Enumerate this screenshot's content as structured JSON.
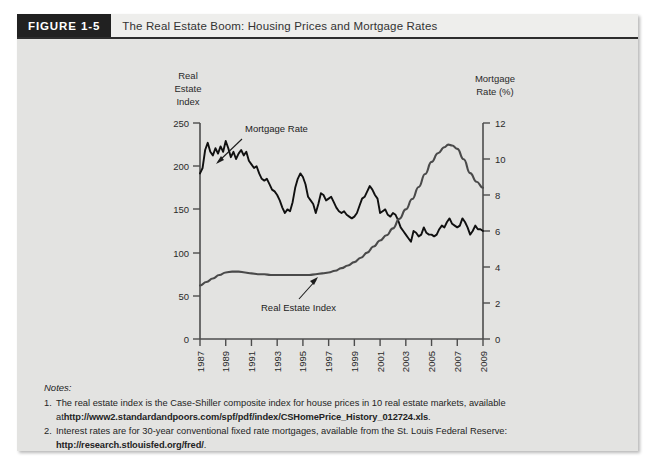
{
  "figure": {
    "tag": "FIGURE 1-5",
    "title": "The Real Estate Boom: Housing Prices and Mortgage Rates"
  },
  "axes": {
    "left_title_line1": "Real",
    "left_title_line2": "Estate",
    "left_title_line3": "Index",
    "right_title_line1": "Mortgage",
    "right_title_line2": "Rate (%)"
  },
  "annotations": {
    "mortgage_rate": "Mortgage Rate",
    "real_estate_index": "Real Estate Index"
  },
  "notes": {
    "heading": "Notes:",
    "items": [
      {
        "num": "1.",
        "text_a": "The real estate index is the Case-Shiller composite index for house prices in 10 real estate markets, available",
        "text_b_lead": "at ",
        "url": "http://www2.standardandpoors.com/spf/pdf/index/CSHomePrice_History_012724.xls",
        "text_b_tail": "."
      },
      {
        "num": "2.",
        "text_a": "Interest rates are for 30-year conventional fixed rate mortgages, available from the St. Louis Federal Reserve:",
        "text_b_lead": "",
        "url": "http://research.stlouisfed.org/fred/",
        "text_b_tail": "."
      }
    ]
  },
  "colors": {
    "tag_background": "#212121",
    "panel_background": "#e3e3e1",
    "header_background": "#eeeeec",
    "mortgage_line": "#101010",
    "real_estate_line": "#4a4a4a"
  },
  "chart_data": {
    "type": "line",
    "title": "The Real Estate Boom: Housing Prices and Mortgage Rates",
    "xlabel": "",
    "ylabel": "Real Estate Index",
    "y2label": "Mortgage Rate (%)",
    "grid": false,
    "legend": "annotated-inline",
    "xlim": [
      1987,
      2009
    ],
    "ylim": [
      0,
      250
    ],
    "y2lim": [
      0,
      12
    ],
    "xticks": [
      1987,
      1989,
      1991,
      1993,
      1995,
      1997,
      1999,
      2001,
      2003,
      2005,
      2007,
      2009
    ],
    "yticks": [
      0,
      50,
      100,
      150,
      200,
      250
    ],
    "y2ticks": [
      0,
      2,
      4,
      6,
      8,
      10,
      12
    ],
    "series": [
      {
        "name": "Mortgage Rate",
        "axis": "right",
        "unit": "%",
        "x": [
          1987.0,
          1987.2,
          1987.4,
          1987.6,
          1987.8,
          1988.0,
          1988.2,
          1988.4,
          1988.6,
          1988.8,
          1989.0,
          1989.2,
          1989.4,
          1989.6,
          1989.8,
          1990.0,
          1990.2,
          1990.4,
          1990.6,
          1990.8,
          1991.0,
          1991.2,
          1991.4,
          1991.6,
          1991.8,
          1992.0,
          1992.2,
          1992.4,
          1992.6,
          1992.8,
          1993.0,
          1993.2,
          1993.4,
          1993.6,
          1993.8,
          1994.0,
          1994.2,
          1994.4,
          1994.6,
          1994.8,
          1995.0,
          1995.2,
          1995.4,
          1995.6,
          1995.8,
          1996.0,
          1996.2,
          1996.4,
          1996.6,
          1996.8,
          1997.0,
          1997.2,
          1997.4,
          1997.6,
          1997.8,
          1998.0,
          1998.2,
          1998.4,
          1998.6,
          1998.8,
          1999.0,
          1999.2,
          1999.4,
          1999.6,
          1999.8,
          2000.0,
          2000.2,
          2000.4,
          2000.6,
          2000.8,
          2001.0,
          2001.2,
          2001.4,
          2001.6,
          2001.8,
          2002.0,
          2002.2,
          2002.4,
          2002.6,
          2002.8,
          2003.0,
          2003.2,
          2003.4,
          2003.6,
          2003.8,
          2004.0,
          2004.2,
          2004.4,
          2004.6,
          2004.8,
          2005.0,
          2005.2,
          2005.4,
          2005.6,
          2005.8,
          2006.0,
          2006.2,
          2006.4,
          2006.6,
          2006.8,
          2007.0,
          2007.2,
          2007.4,
          2007.6,
          2007.8,
          2008.0,
          2008.2,
          2008.4,
          2008.6,
          2008.8,
          2009.0
        ],
        "y": [
          9.2,
          9.5,
          10.5,
          10.9,
          10.4,
          10.2,
          10.6,
          10.3,
          10.7,
          10.4,
          11.0,
          10.6,
          10.1,
          10.4,
          10.0,
          10.3,
          10.5,
          10.2,
          10.4,
          9.9,
          9.7,
          9.5,
          9.6,
          9.2,
          8.9,
          8.8,
          8.9,
          8.6,
          8.3,
          8.2,
          8.0,
          7.7,
          7.3,
          7.0,
          7.2,
          7.1,
          7.6,
          8.4,
          8.9,
          9.2,
          9.0,
          8.6,
          7.9,
          7.7,
          7.5,
          7.0,
          7.5,
          8.1,
          8.0,
          7.7,
          7.8,
          7.9,
          7.6,
          7.3,
          7.1,
          7.0,
          7.1,
          6.9,
          6.8,
          6.7,
          6.8,
          7.0,
          7.4,
          7.8,
          7.9,
          8.2,
          8.5,
          8.3,
          8.0,
          7.8,
          7.0,
          7.1,
          7.2,
          6.9,
          6.8,
          7.0,
          6.9,
          6.6,
          6.2,
          6.0,
          5.8,
          5.6,
          5.4,
          6.0,
          5.9,
          5.7,
          5.8,
          6.2,
          5.9,
          5.8,
          5.8,
          5.7,
          5.8,
          6.1,
          6.3,
          6.2,
          6.5,
          6.7,
          6.4,
          6.3,
          6.2,
          6.3,
          6.7,
          6.5,
          6.2,
          5.8,
          6.0,
          6.3,
          6.1,
          6.1,
          6.0
        ]
      },
      {
        "name": "Real Estate Index",
        "axis": "left",
        "unit": "index",
        "x": [
          1987.0,
          1987.5,
          1988.0,
          1988.5,
          1989.0,
          1989.5,
          1990.0,
          1990.5,
          1991.0,
          1991.5,
          1992.0,
          1992.5,
          1993.0,
          1993.5,
          1994.0,
          1994.5,
          1995.0,
          1995.5,
          1996.0,
          1996.5,
          1997.0,
          1997.5,
          1998.0,
          1998.5,
          1999.0,
          1999.5,
          2000.0,
          2000.5,
          2001.0,
          2001.5,
          2002.0,
          2002.5,
          2003.0,
          2003.5,
          2004.0,
          2004.5,
          2005.0,
          2005.5,
          2006.0,
          2006.3,
          2006.6,
          2007.0,
          2007.5,
          2008.0,
          2008.5,
          2009.0
        ],
        "y": [
          62,
          66,
          70,
          74,
          77,
          78,
          78,
          77,
          76,
          75,
          75,
          74,
          74,
          74,
          74,
          74,
          74,
          74,
          75,
          76,
          77,
          79,
          82,
          85,
          89,
          94,
          100,
          107,
          114,
          120,
          128,
          139,
          150,
          162,
          176,
          191,
          205,
          215,
          222,
          225,
          224,
          220,
          208,
          192,
          182,
          175
        ]
      }
    ]
  }
}
